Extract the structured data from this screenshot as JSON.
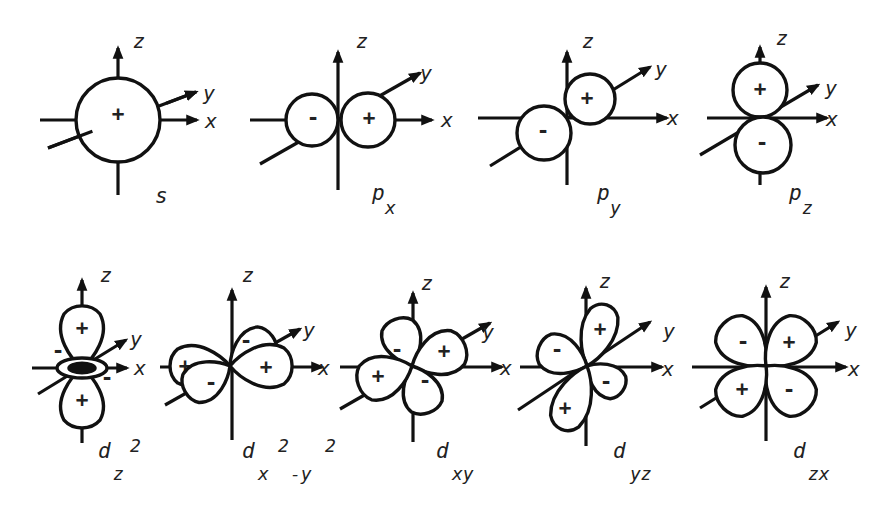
{
  "diagram": {
    "colors": {
      "ink": "#111111",
      "background": "#ffffff"
    },
    "axis_labels": {
      "x": "x",
      "y": "y",
      "z": "z"
    },
    "orbitals": [
      {
        "id": "s",
        "name": "s",
        "subscript": "",
        "superscript": "",
        "label_pos": [
          155,
          203
        ],
        "z_axis": {
          "x": 118,
          "top": 48,
          "bottom": 195
        },
        "x_axis": {
          "y": 120,
          "left": 40,
          "right": 197
        },
        "y_axis": {
          "x1": 48,
          "y1": 148,
          "x2": 196,
          "y2": 92
        },
        "axis_label_pos": {
          "z": [
            133,
            48
          ],
          "y": [
            203,
            100
          ],
          "x": [
            205,
            128
          ]
        },
        "lobes": [
          {
            "type": "circle",
            "cx": 118,
            "cy": 120,
            "r": 42,
            "sign": "+",
            "sign_pos": [
              118,
              114
            ]
          }
        ],
        "draw_order": "y_back"
      },
      {
        "id": "px",
        "name": "p",
        "subscript": "x",
        "superscript": "",
        "label_pos": [
          372,
          200
        ],
        "sub_pos": [
          385,
          214
        ],
        "z_axis": {
          "x": 338,
          "top": 52,
          "bottom": 190
        },
        "x_axis": {
          "y": 120,
          "left": 250,
          "right": 432
        },
        "y_axis": {
          "x1": 260,
          "y1": 164,
          "x2": 420,
          "y2": 73
        },
        "axis_label_pos": {
          "z": [
            356,
            48
          ],
          "y": [
            420,
            80
          ],
          "x": [
            441,
            127
          ]
        },
        "lobes": [
          {
            "type": "circle",
            "cx": 312,
            "cy": 120,
            "r": 26,
            "sign": "-",
            "sign_pos": [
              313,
              118
            ]
          },
          {
            "type": "circle",
            "cx": 368,
            "cy": 120,
            "r": 27,
            "sign": "+",
            "sign_pos": [
              369,
              118
            ]
          }
        ]
      },
      {
        "id": "py",
        "name": "p",
        "subscript": "y",
        "superscript": "",
        "label_pos": [
          597,
          200
        ],
        "sub_pos": [
          610,
          214
        ],
        "z_axis": {
          "x": 567,
          "top": 52,
          "bottom": 185
        },
        "x_axis": {
          "y": 118,
          "left": 478,
          "right": 667
        },
        "y_axis": {
          "x1": 490,
          "y1": 166,
          "x2": 650,
          "y2": 67
        },
        "axis_label_pos": {
          "z": [
            582,
            48
          ],
          "y": [
            655,
            76
          ],
          "x": [
            667,
            125
          ]
        },
        "lobes": [
          {
            "type": "circle",
            "cx": 590,
            "cy": 99,
            "r": 25,
            "sign": "+",
            "sign_pos": [
              587,
              98
            ]
          },
          {
            "type": "circle",
            "cx": 544,
            "cy": 133,
            "r": 27,
            "sign": "-",
            "sign_pos": [
              543,
              131
            ]
          }
        ]
      },
      {
        "id": "pz",
        "name": "p",
        "subscript": "z",
        "superscript": "",
        "label_pos": [
          789,
          200
        ],
        "sub_pos": [
          802,
          214
        ],
        "z_axis": {
          "x": 760,
          "top": 47,
          "bottom": 185
        },
        "x_axis": {
          "y": 118,
          "left": 707,
          "right": 827
        },
        "y_axis": {
          "x1": 700,
          "y1": 155,
          "x2": 818,
          "y2": 85
        },
        "axis_label_pos": {
          "z": [
            776,
            45
          ],
          "y": [
            825,
            95
          ],
          "x": [
            826,
            126
          ]
        },
        "lobes": [
          {
            "type": "circle",
            "cx": 760,
            "cy": 90,
            "r": 27,
            "sign": "+",
            "sign_pos": [
              760,
              89
            ]
          },
          {
            "type": "circle",
            "cx": 763,
            "cy": 145,
            "r": 28,
            "sign": "-",
            "sign_pos": [
              762,
              143
            ]
          }
        ]
      },
      {
        "id": "dz2",
        "name": "d",
        "subscript": "z",
        "superscript": "2",
        "label_pos": [
          98,
          458
        ],
        "sub_pos": [
          113,
          480
        ],
        "sup_pos": [
          130,
          452
        ],
        "z_axis": {
          "x": 82,
          "top": 280,
          "bottom": 443
        },
        "x_axis": {
          "y": 368,
          "left": 32,
          "right": 127
        },
        "y_axis": {
          "x1": 38,
          "y1": 394,
          "x2": 126,
          "y2": 340
        },
        "axis_label_pos": {
          "z": [
            100,
            282
          ],
          "y": [
            130,
            346
          ],
          "x": [
            134,
            375
          ]
        },
        "lobes": [
          {
            "type": "drop",
            "ox": 82,
            "oy": 368,
            "angle": -90,
            "len": 60,
            "w": 20,
            "sign": "+",
            "sign_pos": [
              82,
              328
            ]
          },
          {
            "type": "drop",
            "ox": 82,
            "oy": 368,
            "angle": 90,
            "len": 58,
            "w": 20,
            "sign": "+",
            "sign_pos": [
              82,
              400
            ]
          },
          {
            "type": "torus",
            "cx": 82,
            "cy": 368,
            "rx": 25,
            "ry": 10,
            "signs": [
              {
                "s": "-",
                "pos": [
                  58,
                  351
                ]
              },
              {
                "s": "-",
                "pos": [
                  107,
                  378
                ]
              }
            ]
          }
        ]
      },
      {
        "id": "dx2y2",
        "name": "d",
        "subscript": "x",
        "superscript": "2",
        "tail": "-y",
        "tail_sup": "2",
        "label_pos": [
          242,
          458
        ],
        "sub_pos": [
          258,
          480
        ],
        "sup_pos": [
          278,
          452
        ],
        "tail_pos": [
          290,
          480
        ],
        "tail_sup_pos": [
          325,
          452
        ],
        "z_axis": {
          "x": 232,
          "top": 290,
          "bottom": 440
        },
        "x_axis": {
          "y": 367,
          "left": 160,
          "right": 322
        },
        "y_axis": {
          "x1": 165,
          "y1": 405,
          "x2": 300,
          "y2": 329
        },
        "axis_label_pos": {
          "z": [
            242,
            282
          ],
          "y": [
            303,
            337
          ],
          "x": [
            318,
            375
          ]
        },
        "lobes": [
          {
            "type": "drop",
            "ox": 230,
            "oy": 366,
            "angle": -35,
            "len": 50,
            "w": 18,
            "sign": "-",
            "sign_pos": [
              246,
              341
            ]
          },
          {
            "type": "drop",
            "ox": 230,
            "oy": 366,
            "angle": 180,
            "len": 58,
            "w": 19,
            "sign": "+",
            "sign_pos": [
              185,
              366
            ]
          },
          {
            "type": "drop",
            "ox": 230,
            "oy": 366,
            "angle": 0,
            "len": 60,
            "w": 20,
            "sign": "+",
            "sign_pos": [
              266,
              367
            ]
          },
          {
            "type": "drop",
            "ox": 230,
            "oy": 366,
            "angle": 150,
            "len": 50,
            "w": 18,
            "sign": "-",
            "sign_pos": [
              211,
              383
            ]
          }
        ]
      },
      {
        "id": "dxy",
        "name": "d",
        "subscript": "xy",
        "superscript": "",
        "label_pos": [
          436,
          458
        ],
        "sub_pos": [
          452,
          480
        ],
        "z_axis": {
          "x": 413,
          "top": 293,
          "bottom": 442
        },
        "x_axis": {
          "y": 367,
          "left": 340,
          "right": 502
        },
        "y_axis": {
          "x1": 340,
          "y1": 409,
          "x2": 490,
          "y2": 323
        },
        "axis_label_pos": {
          "z": [
            421,
            290
          ],
          "y": [
            482,
            339
          ],
          "x": [
            500,
            375
          ]
        },
        "lobes": [
          {
            "type": "drop",
            "ox": 412,
            "oy": 366,
            "angle": -110,
            "len": 48,
            "w": 18,
            "sign": "-",
            "sign_pos": [
              397,
              350
            ]
          },
          {
            "type": "drop",
            "ox": 412,
            "oy": 366,
            "angle": -22,
            "len": 55,
            "w": 20,
            "sign": "+",
            "sign_pos": [
              444,
              351
            ]
          },
          {
            "type": "drop",
            "ox": 412,
            "oy": 366,
            "angle": 70,
            "len": 48,
            "w": 18,
            "sign": "-",
            "sign_pos": [
              425,
              381
            ]
          },
          {
            "type": "drop",
            "ox": 412,
            "oy": 366,
            "angle": 160,
            "len": 55,
            "w": 20,
            "sign": "+",
            "sign_pos": [
              378,
              376
            ]
          }
        ]
      },
      {
        "id": "dyz",
        "name": "d",
        "subscript": "yz",
        "superscript": "",
        "label_pos": [
          613,
          458
        ],
        "sub_pos": [
          630,
          480
        ],
        "z_axis": {
          "x": 586,
          "top": 288,
          "bottom": 446
        },
        "x_axis": {
          "y": 367,
          "left": 520,
          "right": 662
        },
        "y_axis": {
          "x1": 518,
          "y1": 410,
          "x2": 650,
          "y2": 322
        },
        "axis_label_pos": {
          "z": [
            599,
            288
          ],
          "y": [
            663,
            338
          ],
          "x": [
            662,
            376
          ]
        },
        "lobes": [
          {
            "type": "drop",
            "ox": 587,
            "oy": 366,
            "angle": -72,
            "len": 62,
            "w": 16,
            "sign": "+",
            "sign_pos": [
              600,
              329
            ]
          },
          {
            "type": "drop",
            "ox": 587,
            "oy": 366,
            "angle": -158,
            "len": 50,
            "w": 18,
            "sign": "-",
            "sign_pos": [
              557,
              350
            ]
          },
          {
            "type": "drop",
            "ox": 587,
            "oy": 366,
            "angle": 35,
            "len": 42,
            "w": 15,
            "sign": "-",
            "sign_pos": [
              606,
              382
            ]
          },
          {
            "type": "drop",
            "ox": 587,
            "oy": 366,
            "angle": 112,
            "len": 66,
            "w": 17,
            "sign": "+",
            "sign_pos": [
              565,
              408
            ]
          }
        ]
      },
      {
        "id": "dzx",
        "name": "d",
        "subscript": "zx",
        "superscript": "",
        "label_pos": [
          793,
          458
        ],
        "sub_pos": [
          808,
          480
        ],
        "z_axis": {
          "x": 766,
          "top": 287,
          "bottom": 441
        },
        "x_axis": {
          "y": 367,
          "left": 692,
          "right": 846
        },
        "y_axis": {
          "x1": 700,
          "y1": 408,
          "x2": 838,
          "y2": 322
        },
        "axis_label_pos": {
          "z": [
            779,
            288
          ],
          "y": [
            845,
            337
          ],
          "x": [
            848,
            376
          ]
        },
        "lobes": [
          {
            "type": "drop",
            "ox": 766,
            "oy": 366,
            "angle": -135,
            "len": 58,
            "w": 21,
            "sign": "-",
            "sign_pos": [
              743,
              342
            ]
          },
          {
            "type": "drop",
            "ox": 766,
            "oy": 366,
            "angle": -45,
            "len": 58,
            "w": 21,
            "sign": "+",
            "sign_pos": [
              789,
              342
            ]
          },
          {
            "type": "drop",
            "ox": 766,
            "oy": 366,
            "angle": 45,
            "len": 58,
            "w": 21,
            "sign": "-",
            "sign_pos": [
              789,
              390
            ]
          },
          {
            "type": "drop",
            "ox": 766,
            "oy": 366,
            "angle": 135,
            "len": 58,
            "w": 21,
            "sign": "+",
            "sign_pos": [
              742,
              389
            ]
          }
        ]
      }
    ]
  }
}
